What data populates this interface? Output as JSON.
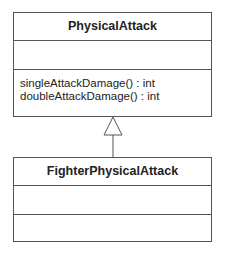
{
  "diagram": {
    "type": "uml-class-diagram",
    "classes": [
      {
        "name": "PhysicalAttack",
        "attributes": [],
        "operations": [
          "singleAttackDamage() : int",
          "doubleAttackDamage() : int"
        ]
      },
      {
        "name": "FighterPhysicalAttack",
        "attributes": [],
        "operations": []
      }
    ],
    "relationships": [
      {
        "type": "generalization",
        "from": "FighterPhysicalAttack",
        "to": "PhysicalAttack"
      }
    ],
    "colors": {
      "line": "#555555",
      "text": "#222222",
      "background": "#ffffff"
    }
  }
}
